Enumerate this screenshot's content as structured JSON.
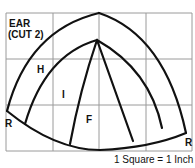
{
  "title_line1": "EAR",
  "title_line2": "(CUT 2)",
  "piece_labels": {
    "h": "H",
    "i": "I",
    "f": "F",
    "r_left": "R",
    "r_right": "R"
  },
  "scale_note": "1 Square = 1 Inch",
  "colors": {
    "line": "#111111",
    "grid": "#9a9a9a",
    "background": "#ffffff"
  },
  "grid": {
    "columns": 4,
    "rows": 3
  }
}
